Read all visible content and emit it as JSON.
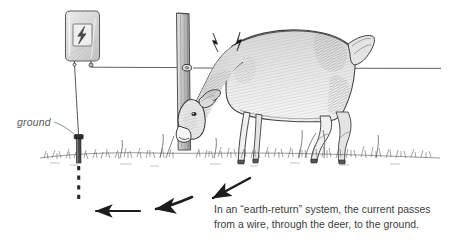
{
  "diagram": {
    "style": "pen-and-ink line illustration",
    "labels": {
      "ground": "ground"
    },
    "caption": {
      "line1": "In an “earth-return” system, the current passes",
      "line2": "from a wire, through the deer, to the ground."
    },
    "components": [
      {
        "name": "energizer-unit",
        "description": "fence charger box with lightning bolt symbol"
      },
      {
        "name": "lightning-bolt-symbol",
        "description": "bolt glyph on energizer panel"
      },
      {
        "name": "ground-wire",
        "description": "vertical lead wire from energizer to ground rod"
      },
      {
        "name": "ground-rod",
        "description": "metal rod driven into soil"
      },
      {
        "name": "underground-current-path",
        "description": "dashed line below soil"
      },
      {
        "name": "fence-post",
        "description": "wooden post with insulator"
      },
      {
        "name": "insulator",
        "description": "wire attachment point on post"
      },
      {
        "name": "fence-wire",
        "description": "horizontal electrified wire"
      },
      {
        "name": "deer",
        "description": "deer touching wire with neck, grazing"
      },
      {
        "name": "spark-bolts",
        "description": "two spark marks at deer-wire contact"
      },
      {
        "name": "grass-line",
        "description": "sketched grass at ground level"
      },
      {
        "name": "current-arrows",
        "description": "three arrows showing flow toward ground rod"
      }
    ],
    "colors": {
      "ink": "#2b2b2b",
      "line": "#4a4a4a",
      "caption_text": "#3c3c3c",
      "label_text": "#5a5a5a",
      "shade_light": "#cfcfcf",
      "shade_mid": "#a8a8a8",
      "shade_dark": "#6e6e6e",
      "background": "#ffffff"
    }
  }
}
